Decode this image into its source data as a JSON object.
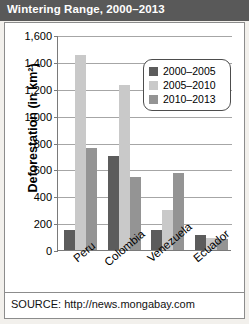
{
  "header": {
    "title": "Wintering Range, 2000–2013"
  },
  "source": {
    "text": "SOURCE: http://news.mongabay.com"
  },
  "legend": {
    "position": "top-right-inside",
    "items": [
      {
        "label": "2000–2005",
        "color": "#5c5c5c"
      },
      {
        "label": "2005–2010",
        "color": "#c9c9c9"
      },
      {
        "label": "2010–2013",
        "color": "#949494"
      }
    ]
  },
  "chart_data": {
    "type": "bar",
    "title": "Wintering Range, 2000–2013",
    "xlabel": "",
    "ylabel": "Deforestation (in km²)",
    "categories": [
      "Peru",
      "Colombia",
      "Venezuela",
      "Ecuador"
    ],
    "series": [
      {
        "name": "2000–2005",
        "color": "#5c5c5c",
        "values": [
          150,
          700,
          150,
          110
        ]
      },
      {
        "name": "2005–2010",
        "color": "#c9c9c9",
        "values": [
          1450,
          1230,
          300,
          90
        ]
      },
      {
        "name": "2010–2013",
        "color": "#949494",
        "values": [
          760,
          540,
          570,
          80
        ]
      }
    ],
    "ylim": [
      0,
      1600
    ],
    "yticks": [
      0,
      200,
      400,
      600,
      800,
      1000,
      1200,
      1400,
      1600
    ],
    "ytick_labels": [
      "0",
      "200",
      "400",
      "600",
      "800",
      "1,000",
      "1,200",
      "1,400",
      "1,600"
    ],
    "grid": true,
    "legend_position": "inside-top-right"
  }
}
